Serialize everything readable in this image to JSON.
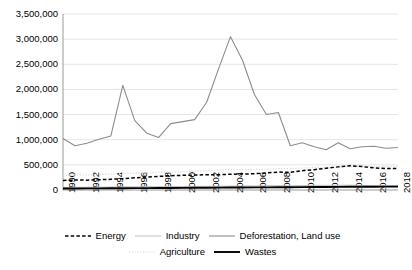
{
  "chart_data": {
    "type": "line",
    "title": "",
    "xlabel": "",
    "ylabel": "",
    "grid": true,
    "legend_position": "bottom",
    "ylim": [
      0,
      3500000
    ],
    "yticks": [
      0,
      500000,
      1000000,
      1500000,
      2000000,
      2500000,
      3000000,
      3500000
    ],
    "ytick_labels": [
      "0",
      "500,000",
      "1,000,000",
      "1,500,000",
      "2,000,000",
      "2,500,000",
      "3,000,000",
      "3,500,000"
    ],
    "x": [
      1990,
      1991,
      1992,
      1993,
      1994,
      1995,
      1996,
      1997,
      1998,
      1999,
      2000,
      2001,
      2002,
      2003,
      2004,
      2005,
      2006,
      2007,
      2008,
      2009,
      2010,
      2011,
      2012,
      2013,
      2014,
      2015,
      2016,
      2017,
      2018
    ],
    "xtick_labels": [
      "1990",
      "1992",
      "1994",
      "1996",
      "1998",
      "2000",
      "2002",
      "2004",
      "2006",
      "2008",
      "2010",
      "2012",
      "2014",
      "2016",
      "2018"
    ],
    "xticks": [
      1990,
      1992,
      1994,
      1996,
      1998,
      2000,
      2002,
      2004,
      2006,
      2008,
      2010,
      2012,
      2014,
      2016,
      2018
    ],
    "series": [
      {
        "name": "Energy",
        "style": "dashed",
        "color": "#000000",
        "values": [
          190000,
          198000,
          196000,
          204000,
          213000,
          226000,
          243000,
          258000,
          271000,
          283000,
          292000,
          297000,
          304000,
          302000,
          314000,
          318000,
          323000,
          339000,
          357000,
          350000,
          385000,
          405000,
          432000,
          460000,
          483000,
          465000,
          439000,
          428000,
          425000
        ]
      },
      {
        "name": "Industry",
        "style": "solid-light",
        "color": "#bfbfbf",
        "values": [
          52000,
          53000,
          54000,
          56000,
          59000,
          62000,
          64000,
          66000,
          67000,
          68000,
          71000,
          70000,
          72000,
          74000,
          78000,
          79000,
          81000,
          85000,
          88000,
          80000,
          90000,
          93000,
          92000,
          94000,
          95000,
          90000,
          87000,
          88000,
          90000
        ]
      },
      {
        "name": "Deforestation, Land use",
        "style": "solid",
        "color": "#8c8c8c",
        "values": [
          1025000,
          880000,
          930000,
          1010000,
          1075000,
          2080000,
          1380000,
          1130000,
          1045000,
          1320000,
          1360000,
          1400000,
          1740000,
          2410000,
          3050000,
          2580000,
          1900000,
          1500000,
          1540000,
          880000,
          940000,
          860000,
          800000,
          940000,
          820000,
          860000,
          870000,
          830000,
          845000
        ]
      },
      {
        "name": "Agriculture",
        "style": "dotted",
        "color": "#d9d9d9",
        "values": [
          290000,
          296000,
          301000,
          307000,
          315000,
          327000,
          333000,
          340000,
          349000,
          357000,
          366000,
          374000,
          386000,
          397000,
          408000,
          410000,
          408000,
          413000,
          424000,
          427000,
          437000,
          446000,
          451000,
          458000,
          466000,
          470000,
          466000,
          469000,
          473000
        ]
      },
      {
        "name": "Wastes",
        "style": "solid-thick",
        "color": "#000000",
        "values": [
          30000,
          31000,
          32000,
          33000,
          34000,
          36000,
          37000,
          38000,
          40000,
          41000,
          43000,
          44000,
          46000,
          47000,
          49000,
          50000,
          52000,
          53000,
          55000,
          56000,
          58000,
          59000,
          61000,
          62000,
          64000,
          65000,
          66000,
          67000,
          68000
        ]
      }
    ]
  },
  "legend": {
    "rows": [
      [
        {
          "label": "Energy",
          "key": "energy"
        },
        {
          "label": "Industry",
          "key": "industry"
        },
        {
          "label": "Deforestation, Land use",
          "key": "deforestation"
        }
      ],
      [
        {
          "label": "Agriculture",
          "key": "agriculture"
        },
        {
          "label": "Wastes",
          "key": "wastes"
        }
      ]
    ]
  }
}
